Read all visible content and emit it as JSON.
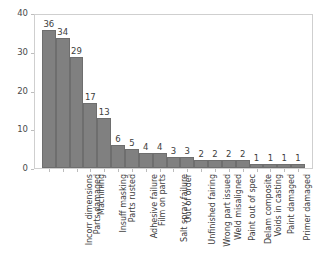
{
  "chart_data": {
    "type": "bar",
    "title": "",
    "subtitle": "",
    "xlabel": "",
    "ylabel": "",
    "ylim": [
      0,
      40
    ],
    "yticks": [
      0,
      10,
      20,
      30,
      40
    ],
    "grid": false,
    "legend": null,
    "bar_color": "#808080",
    "bar_edge_color": "#6e6e6e",
    "frame_color": "#cfcfcf",
    "text_color": "#3d3d3d",
    "background": "#ffffff",
    "value_labels_shown": true,
    "xtick_rotation": -90,
    "categories": [
      "Incorr dimensions",
      "Parts damaged",
      "Machining",
      "Insuff masking",
      "Parts rusted",
      "Adhesive failure",
      "Film on parts",
      "Salt spray failure",
      "Out of order",
      "Unfinished fairing",
      "Wrong part issued",
      "Weld misaligned",
      "Paint out of spec",
      "Delam composite",
      "Voids in casting",
      "Paint damaged",
      "Primer damaged",
      "Improper procedure",
      "Powdery alodine"
    ],
    "values": [
      36,
      34,
      29,
      17,
      13,
      6,
      5,
      4,
      4,
      3,
      3,
      2,
      2,
      2,
      2,
      1,
      1,
      1,
      1
    ]
  }
}
